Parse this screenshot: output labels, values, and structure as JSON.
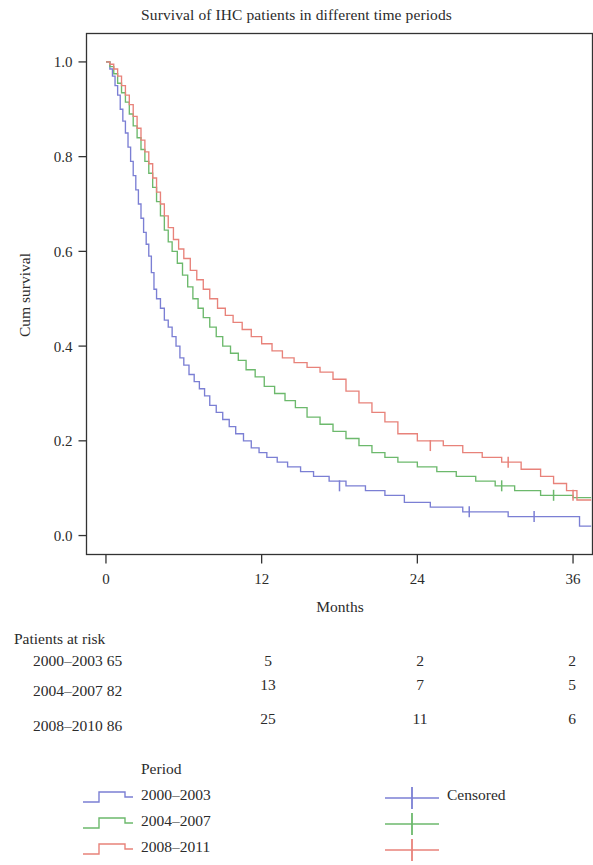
{
  "chart_data": {
    "type": "line",
    "title": "Survival of IHC patients in different time periods",
    "xlabel": "Months",
    "ylabel": "Cum survival",
    "xlim": [
      -1.5,
      37.5
    ],
    "ylim": [
      -0.04,
      1.06
    ],
    "xticks": [
      0,
      12,
      24,
      36
    ],
    "xtick_labels": [
      "0",
      "12",
      "24",
      "36"
    ],
    "yticks": [
      0.0,
      0.2,
      0.4,
      0.6,
      0.8,
      1.0
    ],
    "ytick_labels": [
      "0.0",
      "0.2",
      "0.4",
      "0.6",
      "0.8",
      "1.0"
    ],
    "grid": false,
    "legend_position": "below-plot",
    "series": [
      {
        "name": "2000-2003",
        "color": "#7b7fd4",
        "points": [
          [
            0.0,
            1.0
          ],
          [
            0.3,
            0.985
          ],
          [
            0.5,
            0.97
          ],
          [
            0.7,
            0.95
          ],
          [
            0.9,
            0.93
          ],
          [
            1.1,
            0.9
          ],
          [
            1.3,
            0.875
          ],
          [
            1.5,
            0.85
          ],
          [
            1.7,
            0.82
          ],
          [
            1.9,
            0.79
          ],
          [
            2.1,
            0.76
          ],
          [
            2.3,
            0.73
          ],
          [
            2.5,
            0.7
          ],
          [
            2.7,
            0.67
          ],
          [
            2.9,
            0.64
          ],
          [
            3.1,
            0.615
          ],
          [
            3.3,
            0.59
          ],
          [
            3.5,
            0.555
          ],
          [
            3.7,
            0.52
          ],
          [
            3.9,
            0.5
          ],
          [
            4.2,
            0.48
          ],
          [
            4.5,
            0.455
          ],
          [
            4.8,
            0.44
          ],
          [
            5.1,
            0.42
          ],
          [
            5.4,
            0.4
          ],
          [
            5.7,
            0.375
          ],
          [
            6.0,
            0.36
          ],
          [
            6.4,
            0.34
          ],
          [
            6.8,
            0.325
          ],
          [
            7.2,
            0.31
          ],
          [
            7.6,
            0.295
          ],
          [
            8.0,
            0.275
          ],
          [
            8.5,
            0.26
          ],
          [
            9.0,
            0.245
          ],
          [
            9.5,
            0.23
          ],
          [
            10.0,
            0.215
          ],
          [
            10.6,
            0.2
          ],
          [
            11.2,
            0.185
          ],
          [
            11.8,
            0.175
          ],
          [
            12.4,
            0.165
          ],
          [
            13.2,
            0.155
          ],
          [
            14.0,
            0.145
          ],
          [
            15.0,
            0.135
          ],
          [
            16.0,
            0.125
          ],
          [
            17.2,
            0.115
          ],
          [
            18.5,
            0.105
          ],
          [
            20.0,
            0.095
          ],
          [
            21.5,
            0.085
          ],
          [
            23.0,
            0.07
          ],
          [
            25.0,
            0.06
          ],
          [
            27.5,
            0.05
          ],
          [
            31.0,
            0.04
          ],
          [
            35.5,
            0.04
          ],
          [
            36.5,
            0.02
          ],
          [
            37.4,
            0.02
          ]
        ],
        "censored": [
          [
            18.0,
            0.105
          ],
          [
            28.0,
            0.05
          ],
          [
            33.0,
            0.04
          ]
        ]
      },
      {
        "name": "2004-2007",
        "color": "#6cb96c",
        "points": [
          [
            0.0,
            1.0
          ],
          [
            0.3,
            0.99
          ],
          [
            0.6,
            0.975
          ],
          [
            0.9,
            0.955
          ],
          [
            1.2,
            0.935
          ],
          [
            1.5,
            0.915
          ],
          [
            1.8,
            0.89
          ],
          [
            2.1,
            0.865
          ],
          [
            2.4,
            0.84
          ],
          [
            2.7,
            0.815
          ],
          [
            3.0,
            0.79
          ],
          [
            3.3,
            0.765
          ],
          [
            3.6,
            0.735
          ],
          [
            3.9,
            0.705
          ],
          [
            4.2,
            0.675
          ],
          [
            4.5,
            0.645
          ],
          [
            4.8,
            0.62
          ],
          [
            5.1,
            0.6
          ],
          [
            5.5,
            0.575
          ],
          [
            5.9,
            0.55
          ],
          [
            6.3,
            0.525
          ],
          [
            6.7,
            0.5
          ],
          [
            7.1,
            0.48
          ],
          [
            7.5,
            0.46
          ],
          [
            8.0,
            0.44
          ],
          [
            8.5,
            0.42
          ],
          [
            9.0,
            0.4
          ],
          [
            9.6,
            0.385
          ],
          [
            10.2,
            0.37
          ],
          [
            10.8,
            0.35
          ],
          [
            11.5,
            0.335
          ],
          [
            12.2,
            0.315
          ],
          [
            13.0,
            0.3
          ],
          [
            13.8,
            0.285
          ],
          [
            14.6,
            0.27
          ],
          [
            15.5,
            0.25
          ],
          [
            16.5,
            0.235
          ],
          [
            17.5,
            0.22
          ],
          [
            18.5,
            0.205
          ],
          [
            19.5,
            0.19
          ],
          [
            20.5,
            0.175
          ],
          [
            21.5,
            0.165
          ],
          [
            22.5,
            0.155
          ],
          [
            24.0,
            0.145
          ],
          [
            25.5,
            0.135
          ],
          [
            27.0,
            0.125
          ],
          [
            28.5,
            0.115
          ],
          [
            30.0,
            0.105
          ],
          [
            31.5,
            0.095
          ],
          [
            33.5,
            0.085
          ],
          [
            36.0,
            0.08
          ],
          [
            37.4,
            0.08
          ]
        ],
        "censored": [
          [
            30.5,
            0.105
          ],
          [
            34.5,
            0.085
          ]
        ]
      },
      {
        "name": "2008-2011",
        "color": "#e8827a",
        "points": [
          [
            0.0,
            1.0
          ],
          [
            0.3,
            0.995
          ],
          [
            0.6,
            0.985
          ],
          [
            0.9,
            0.97
          ],
          [
            1.2,
            0.95
          ],
          [
            1.5,
            0.93
          ],
          [
            1.8,
            0.91
          ],
          [
            2.1,
            0.885
          ],
          [
            2.4,
            0.86
          ],
          [
            2.7,
            0.835
          ],
          [
            3.0,
            0.81
          ],
          [
            3.3,
            0.785
          ],
          [
            3.6,
            0.755
          ],
          [
            3.9,
            0.725
          ],
          [
            4.2,
            0.7
          ],
          [
            4.5,
            0.675
          ],
          [
            4.8,
            0.65
          ],
          [
            5.2,
            0.625
          ],
          [
            5.6,
            0.605
          ],
          [
            6.0,
            0.585
          ],
          [
            6.5,
            0.56
          ],
          [
            7.0,
            0.54
          ],
          [
            7.5,
            0.52
          ],
          [
            8.0,
            0.5
          ],
          [
            8.6,
            0.48
          ],
          [
            9.2,
            0.465
          ],
          [
            9.8,
            0.45
          ],
          [
            10.5,
            0.435
          ],
          [
            11.2,
            0.42
          ],
          [
            12.0,
            0.405
          ],
          [
            12.8,
            0.39
          ],
          [
            13.6,
            0.375
          ],
          [
            14.5,
            0.365
          ],
          [
            15.5,
            0.355
          ],
          [
            16.5,
            0.345
          ],
          [
            17.5,
            0.33
          ],
          [
            18.5,
            0.305
          ],
          [
            19.5,
            0.28
          ],
          [
            20.5,
            0.26
          ],
          [
            21.5,
            0.24
          ],
          [
            22.5,
            0.215
          ],
          [
            24.0,
            0.2
          ],
          [
            26.0,
            0.19
          ],
          [
            27.5,
            0.175
          ],
          [
            29.0,
            0.165
          ],
          [
            30.5,
            0.155
          ],
          [
            32.0,
            0.14
          ],
          [
            33.5,
            0.125
          ],
          [
            34.5,
            0.11
          ],
          [
            35.5,
            0.095
          ],
          [
            36.3,
            0.075
          ],
          [
            37.4,
            0.075
          ]
        ],
        "censored": [
          [
            25.0,
            0.19
          ],
          [
            31.0,
            0.155
          ],
          [
            36.0,
            0.085
          ]
        ]
      }
    ]
  },
  "risk_table": {
    "heading": "Patients at risk",
    "rows": [
      {
        "label": "2000–2003 65",
        "values": [
          "5",
          "2",
          "2"
        ]
      },
      {
        "label": "2004–2007 82",
        "values": [
          "13",
          "7",
          "5"
        ]
      },
      {
        "label": "2008–2010 86",
        "values": [
          "25",
          "11",
          "6"
        ]
      }
    ]
  },
  "legend": {
    "heading": "Period",
    "items": [
      {
        "label": "2000–2003",
        "color": "#7b7fd4"
      },
      {
        "label": "2004–2007",
        "color": "#6cb96c"
      },
      {
        "label": "2008–2011",
        "color": "#e8827a"
      }
    ],
    "censored_label": "Censored"
  }
}
